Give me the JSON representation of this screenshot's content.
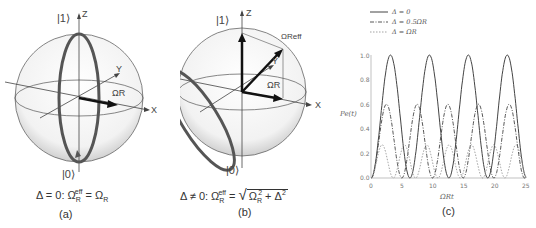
{
  "panel_a": {
    "ket_one": "|1⟩",
    "ket_zero": "|0⟩",
    "axis_z": "Z",
    "axis_y": "Y",
    "axis_x": "X",
    "vector_label": "ΩR",
    "equation": "Δ = 0: ΩReff = ΩR",
    "eq_parts": {
      "lhs": "Δ = 0: Ω",
      "sub1": "R",
      "sup1": "eff",
      "mid": " = Ω",
      "sub2": "R"
    },
    "caption": "(a)"
  },
  "panel_b": {
    "ket_one": "|1⟩",
    "ket_zero": "|0⟩",
    "axis_z": "Z",
    "axis_y": "Y",
    "axis_x": "X",
    "vector_label": "ΩR",
    "vector_eff_label": "ΩReff",
    "eq_parts": {
      "lhs": "Δ ≠ 0: Ω",
      "sub1": "R",
      "sup1": "eff",
      "mid": " = ",
      "rad_a": "Ω",
      "rad_sub": "R",
      "rad_sup": "2",
      "rad_b": " + Δ",
      "rad_sup2": "2"
    },
    "caption": "(b)"
  },
  "panel_c": {
    "caption": "(c)",
    "ylabel": "Pe(t)",
    "xlabel": "ΩRt",
    "legend": [
      "Δ = 0",
      "Δ = 0.5ΩR",
      "Δ = ΩR"
    ],
    "yticks": [
      "0.0",
      "0.2",
      "0.4",
      "0.6",
      "0.8",
      "1.0"
    ],
    "xticks": [
      "0",
      "5",
      "10",
      "15",
      "20",
      "25"
    ]
  },
  "chart_data": {
    "type": "line",
    "title": "",
    "xlabel": "Ω_R t",
    "ylabel": "P_e(t)",
    "xlim": [
      0,
      25
    ],
    "ylim": [
      0,
      1.0
    ],
    "grid": false,
    "legend_position": "top-left, above plot",
    "series": [
      {
        "name": "Δ = 0",
        "style": "solid",
        "amplitude": 1.0,
        "period": 6.28,
        "peaks_x": [
          3.14,
          9.42,
          15.71,
          21.99
        ]
      },
      {
        "name": "Δ = 0.5Ω_R",
        "style": "dash-dot",
        "amplitude": 0.6,
        "period": 4.95,
        "peaks_x": [
          2.5,
          7.4,
          12.4,
          17.3,
          22.3
        ]
      },
      {
        "name": "Δ = Ω_R",
        "style": "dotted",
        "amplitude": 0.27,
        "period": 3.6,
        "peaks_x": [
          1.8,
          5.4,
          9.0,
          12.6,
          16.2,
          19.8,
          23.4
        ]
      }
    ]
  }
}
